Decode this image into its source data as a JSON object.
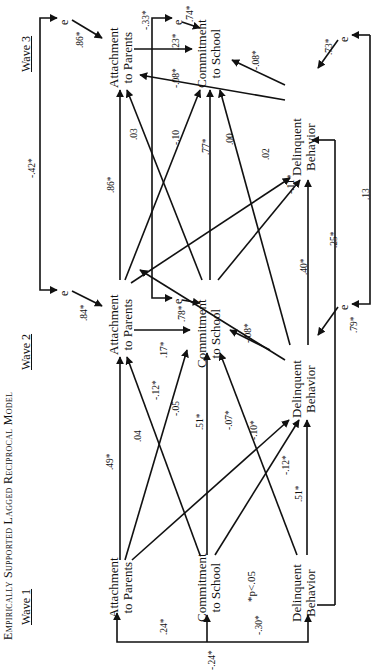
{
  "title": "Empirically Supported Lagged Reciprocal Model",
  "orientation": "rotated 90 degrees counterclockwise",
  "waves": [
    {
      "label": "Wave 1"
    },
    {
      "label": "Wave 2"
    },
    {
      "label": "Wave 3"
    }
  ],
  "nodes": {
    "w1_ap": {
      "line1": "Attachment",
      "line2": "to Parents"
    },
    "w1_cs": {
      "line1": "Commitment",
      "line2": "to School"
    },
    "w1_db": {
      "line1": "Delinquent",
      "line2": "Behavior"
    },
    "w2_ap": {
      "line1": "Attachment",
      "line2": "to Parents"
    },
    "w2_cs": {
      "line1": "Commitment",
      "line2": "to School"
    },
    "w2_db": {
      "line1": "Delinquent",
      "line2": "Behavior"
    },
    "w3_ap": {
      "line1": "Attachment",
      "line2": "to Parents"
    },
    "w3_cs": {
      "line1": "Commitment",
      "line2": "to School"
    },
    "w3_db": {
      "line1": "Delinquent",
      "line2": "Behavior"
    }
  },
  "error_label": "e",
  "coefficients": {
    "w1_ap_cs_corr": ".24*",
    "w1_ap_db_corr": "-.24*",
    "w1_cs_db_corr": "-.30*",
    "ap1_ap2": ".49*",
    "cs1_ap2": ".04",
    "db1_ap2": "-.05",
    "ap1_cs2": "-.12*",
    "cs1_cs2": ".51*",
    "ap1_db2": "-.07*",
    "cs1_db2": "-.10*",
    "db1_cs2": "-.12*",
    "db1_db2": ".51*",
    "ap2_cs2": ".17*",
    "db2_cs2": "-.08*",
    "db2_ap2": "-.12*",
    "e_ap2": ".84*",
    "e_cs2": ".78*",
    "e_db2": ".79*",
    "ap2_ap3": ".86*",
    "cs2_ap3": ".03",
    "ap2_cs3": "-.10",
    "cs2_cs3": ".77*",
    "db2_ap3": ".00",
    "ap2_db3": ".02",
    "cs2_db3": "-.11*",
    "db2_db3": ".40*",
    "db1_db3": ".25*",
    "e_ap2_e_ap3": "-.42*",
    "e_cs2_e_cs3": "-.33*",
    "e_db2_e_db3": ".13",
    "ap3_cs3": ".23*",
    "db3_ap3": "-.08*",
    "db3_cs3": "-.08*",
    "e_ap3": ".86*",
    "e_cs3": ".74*",
    "e_db3": ".73*"
  },
  "note": "*p<.05"
}
